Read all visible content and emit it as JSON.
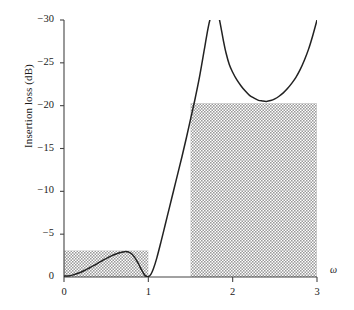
{
  "chart_data": {
    "type": "line",
    "title": "",
    "subtitle": "",
    "xlabel": "ω",
    "ylabel": "Insertion loss (dB)",
    "xlim": [
      0,
      3
    ],
    "ylim": [
      -30,
      0
    ],
    "y_axis_inverted": true,
    "grid": false,
    "legend": null,
    "xticks": [
      {
        "value": 0,
        "label": "0"
      },
      {
        "value": 1,
        "label": "1"
      },
      {
        "value": 2,
        "label": "2"
      },
      {
        "value": 3,
        "label": "3"
      }
    ],
    "yticks": [
      {
        "value": -30,
        "label": "−30"
      },
      {
        "value": -25,
        "label": "−25"
      },
      {
        "value": -20,
        "label": "−20"
      },
      {
        "value": -15,
        "label": "−15"
      },
      {
        "value": -10,
        "label": "−10"
      },
      {
        "value": -5,
        "label": "−5"
      },
      {
        "value": 0,
        "label": "0"
      }
    ],
    "series": [
      {
        "name": "Insertion loss",
        "color": "#222222",
        "x": [
          0.0,
          0.05,
          0.1,
          0.15,
          0.2,
          0.25,
          0.3,
          0.35,
          0.4,
          0.45,
          0.5,
          0.55,
          0.6,
          0.65,
          0.7,
          0.72,
          0.75,
          0.78,
          0.8,
          0.83,
          0.86,
          0.89,
          0.92,
          0.95,
          0.97,
          1.0,
          1.03,
          1.06,
          1.1,
          1.15,
          1.2,
          1.25,
          1.3,
          1.35,
          1.4,
          1.45,
          1.5,
          1.55,
          1.6,
          1.64,
          1.67,
          1.7,
          1.72,
          1.74,
          1.755,
          1.765,
          1.775,
          1.805,
          1.815,
          1.825,
          1.84,
          1.86,
          1.89,
          1.92,
          1.96,
          2.0,
          2.05,
          2.1,
          2.15,
          2.2,
          2.25,
          2.3,
          2.35,
          2.4,
          2.45,
          2.5,
          2.55,
          2.6,
          2.65,
          2.7,
          2.75,
          2.8,
          2.85,
          2.9,
          2.95,
          3.0
        ],
        "y": [
          -0.1,
          -0.13,
          -0.22,
          -0.37,
          -0.56,
          -0.79,
          -1.05,
          -1.32,
          -1.6,
          -1.89,
          -2.15,
          -2.4,
          -2.62,
          -2.8,
          -2.93,
          -2.96,
          -2.95,
          -2.85,
          -2.72,
          -2.4,
          -1.95,
          -1.4,
          -0.82,
          -0.32,
          -0.12,
          -0.05,
          -0.3,
          -0.95,
          -2.2,
          -4.1,
          -6.1,
          -8.1,
          -10.1,
          -12.1,
          -14.1,
          -16.2,
          -18.4,
          -20.6,
          -23.0,
          -25.2,
          -26.9,
          -28.6,
          -29.6,
          -30.4,
          -30.9,
          -31.4,
          -31.8,
          -31.8,
          -31.4,
          -30.9,
          -30.2,
          -29.2,
          -27.6,
          -26.2,
          -24.8,
          -23.9,
          -23.0,
          -22.3,
          -21.7,
          -21.2,
          -20.9,
          -20.65,
          -20.55,
          -20.5,
          -20.6,
          -20.8,
          -21.1,
          -21.5,
          -22.0,
          -22.6,
          -23.3,
          -24.2,
          -25.3,
          -26.6,
          -28.2,
          -30.0
        ],
        "asymptote_pole": 1.79,
        "ripple_peak": {
          "x": 0.72,
          "y": -2.96
        },
        "stopband_local_min": {
          "x": 2.4,
          "y": -20.5
        }
      }
    ],
    "shaded_regions": [
      {
        "name": "passband-spec-box",
        "x0": 0.0,
        "x1": 1.0,
        "y0": 0.0,
        "y1": -3.1,
        "fill": "#c9c9c9",
        "pattern": "hatched"
      },
      {
        "name": "stopband-spec-box",
        "x0": 1.5,
        "x1": 3.0,
        "y0": 0.0,
        "y1": -20.3,
        "fill": "#c9c9c9",
        "pattern": "hatched"
      }
    ],
    "axis_color": "#444444",
    "background": "#ffffff"
  },
  "axis": {
    "x_symbol": "ω",
    "y_title": "Insertion loss (dB)"
  }
}
